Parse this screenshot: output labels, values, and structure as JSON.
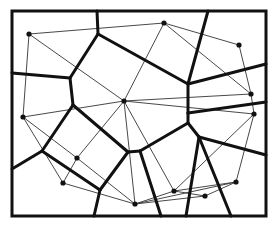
{
  "diagram": {
    "frame": {
      "x": 12,
      "y": 11,
      "width": 254,
      "height": 205
    },
    "colors": {
      "voronoi": "#111111",
      "delaunay": "#333333",
      "site": "#111111",
      "background": "#ffffff"
    },
    "sites": [
      {
        "id": "P1",
        "x": 29,
        "y": 34
      },
      {
        "id": "P2",
        "x": 164,
        "y": 23
      },
      {
        "id": "P3",
        "x": 239,
        "y": 45
      },
      {
        "id": "P4",
        "x": 251,
        "y": 94
      },
      {
        "id": "P5",
        "x": 254,
        "y": 114
      },
      {
        "id": "P6",
        "x": 124,
        "y": 101
      },
      {
        "id": "P7",
        "x": 23,
        "y": 117
      },
      {
        "id": "P8",
        "x": 77,
        "y": 158
      },
      {
        "id": "P9",
        "x": 63,
        "y": 183
      },
      {
        "id": "P10",
        "x": 174,
        "y": 191
      },
      {
        "id": "P11",
        "x": 205,
        "y": 196
      },
      {
        "id": "P12",
        "x": 236,
        "y": 182
      },
      {
        "id": "P13",
        "x": 135,
        "y": 204
      }
    ],
    "voronoi_edges": [
      [
        97,
        11,
        98,
        34
      ],
      [
        98,
        34,
        70,
        78
      ],
      [
        70,
        78,
        12,
        73
      ],
      [
        98,
        34,
        188,
        84
      ],
      [
        208,
        11,
        188,
        84
      ],
      [
        188,
        84,
        266,
        64
      ],
      [
        188,
        84,
        188,
        113
      ],
      [
        188,
        113,
        266,
        102
      ],
      [
        188,
        113,
        188,
        123
      ],
      [
        188,
        123,
        199,
        137
      ],
      [
        199,
        137,
        266,
        155
      ],
      [
        199,
        137,
        186,
        216
      ],
      [
        199,
        137,
        231,
        216
      ],
      [
        188,
        123,
        140,
        151
      ],
      [
        140,
        151,
        128,
        152
      ],
      [
        140,
        151,
        161,
        216
      ],
      [
        70,
        78,
        73,
        105
      ],
      [
        73,
        105,
        128,
        152
      ],
      [
        73,
        105,
        42,
        151
      ],
      [
        42,
        151,
        12,
        169
      ],
      [
        42,
        151,
        100,
        190
      ],
      [
        128,
        152,
        100,
        190
      ],
      [
        100,
        190,
        94,
        216
      ]
    ],
    "delaunay_edges": [
      [
        "P1",
        "P2"
      ],
      [
        "P1",
        "P6"
      ],
      [
        "P1",
        "P7"
      ],
      [
        "P2",
        "P6"
      ],
      [
        "P2",
        "P3"
      ],
      [
        "P2",
        "P4"
      ],
      [
        "P3",
        "P4"
      ],
      [
        "P4",
        "P6"
      ],
      [
        "P4",
        "P5"
      ],
      [
        "P5",
        "P6"
      ],
      [
        "P5",
        "P10"
      ],
      [
        "P5",
        "P12"
      ],
      [
        "P6",
        "P7"
      ],
      [
        "P6",
        "P8"
      ],
      [
        "P6",
        "P13"
      ],
      [
        "P6",
        "P10"
      ],
      [
        "P7",
        "P8"
      ],
      [
        "P7",
        "P9"
      ],
      [
        "P8",
        "P9"
      ],
      [
        "P8",
        "P13"
      ],
      [
        "P9",
        "P13"
      ],
      [
        "P13",
        "P10"
      ],
      [
        "P13",
        "P11"
      ],
      [
        "P13",
        "P12"
      ],
      [
        "P10",
        "P12"
      ],
      [
        "P10",
        "P11"
      ],
      [
        "P11",
        "P12"
      ]
    ]
  }
}
